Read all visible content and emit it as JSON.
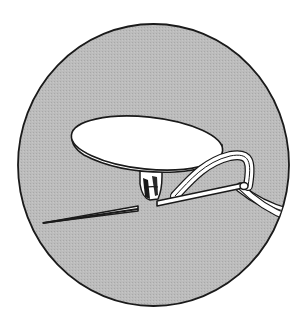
{
  "illustration": {
    "subject": "sewing a button with needle and thread",
    "colors": {
      "background": "#ffffff",
      "fabric": "#b9b9b9",
      "outline": "#1a1a1a",
      "button": "#ffffff",
      "thread": "#ffffff"
    },
    "circle": {
      "cx": 153.5,
      "cy": 165,
      "rx": 135.5,
      "ry": 141
    }
  }
}
